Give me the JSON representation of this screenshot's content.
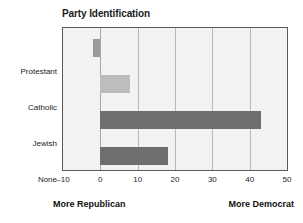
{
  "chart_data": {
    "type": "bar",
    "orientation": "horizontal",
    "title": "Party Identification",
    "categories": [
      "Protestant",
      "Catholic",
      "Jewish",
      "None"
    ],
    "values": [
      -2,
      8,
      43,
      18
    ],
    "xlabel": "",
    "ylabel": "",
    "xlim": [
      -10,
      50
    ],
    "xticks": [
      -10,
      0,
      10,
      20,
      30,
      40,
      50
    ],
    "xtick_labels": [
      "–10",
      "0",
      "10",
      "20",
      "30",
      "40",
      "50"
    ],
    "grid": true,
    "legend": false,
    "bar_colors": [
      "#9a9a9a",
      "#bdbdbd",
      "#6e6e6e",
      "#6e6e6e"
    ],
    "annotations": {
      "left": "More Republican",
      "right": "More Democrat"
    },
    "colors": {
      "plot_background": "#f2f2f0",
      "frame": "#5a5a5a",
      "gridline": "#b9b9b7",
      "text": "#1c1c1c"
    }
  }
}
